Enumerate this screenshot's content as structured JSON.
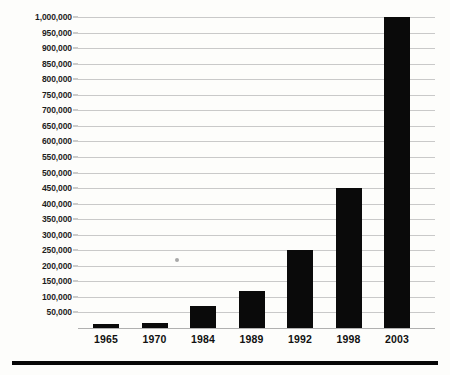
{
  "chart_data": {
    "type": "bar",
    "title": "",
    "subtitle": "",
    "xlabel": "",
    "ylabel": "",
    "categories": [
      "1965",
      "1970",
      "1984",
      "1989",
      "1992",
      "1998",
      "2003"
    ],
    "values": [
      12000,
      15000,
      70000,
      120000,
      250000,
      450000,
      1000000
    ],
    "series": [
      {
        "name": "",
        "values": [
          12000,
          15000,
          70000,
          120000,
          250000,
          450000,
          1000000
        ]
      }
    ],
    "ylim": [
      0,
      1000000
    ],
    "ytick_values": [
      50000,
      100000,
      150000,
      200000,
      250000,
      300000,
      350000,
      400000,
      450000,
      500000,
      550000,
      600000,
      650000,
      700000,
      750000,
      800000,
      850000,
      900000,
      950000,
      1000000
    ],
    "ytick_labels": [
      "50,000",
      "100,000",
      "150,000",
      "200,000",
      "250,000",
      "300,000",
      "350,000",
      "400,000",
      "450,000",
      "500,000",
      "550,000",
      "600,000",
      "650,000",
      "700,000",
      "750,000",
      "800,000",
      "850,000",
      "900,000",
      "950,000",
      "1,000,000"
    ],
    "grid": true,
    "grid_axis": "y",
    "legend": false,
    "legend_position": "none",
    "bar_color": "#0a0a0a",
    "gridline_color": "#c9c9c9",
    "background_color": "#fdfdfb",
    "annotations": []
  },
  "figure": {
    "bottom_rule_color": "#070707",
    "artifact_speck_color": "#a8a8a8"
  }
}
